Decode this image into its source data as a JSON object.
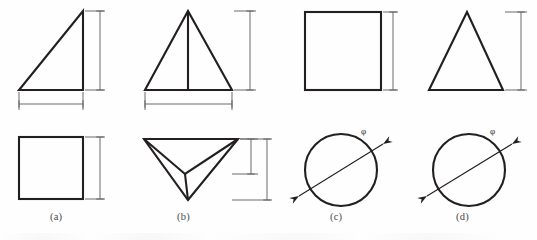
{
  "figure": {
    "type": "engineering-orthographic-projection-exercise",
    "caption_row_labels": [
      "(a)",
      "(b)",
      "(c)",
      "(d)"
    ],
    "rows": {
      "top_row_name": "elevation-views",
      "bottom_row_name": "plan-views"
    },
    "items": [
      {
        "id": "a",
        "label": "(a)",
        "label_x": 62,
        "label_y": 213,
        "elevation": {
          "shape": "right-triangle",
          "description": "right triangle with vertical right leg and horizontal bottom leg",
          "points": "20,90 20,90 83,90 83,12",
          "dimensions": [
            "vertical-right",
            "horizontal-bottom"
          ]
        },
        "plan": {
          "shape": "rectangle",
          "description": "rectangle plan view",
          "dimensions": [
            "vertical-right"
          ]
        }
      },
      {
        "id": "b",
        "label": "(b)",
        "label_x": 188,
        "label_y": 213,
        "elevation": {
          "shape": "isoceles-triangle-with-centerline",
          "description": "isoceles triangle with vertical center line from apex to base",
          "dimensions": [
            "vertical-right",
            "horizontal-bottom"
          ]
        },
        "plan": {
          "shape": "inverted-pyramid-pictorial",
          "description": "inverted triangular pyramid with visible internal converging edges",
          "dimensions": [
            "vertical-inner",
            "vertical-outer"
          ]
        }
      },
      {
        "id": "c",
        "label": "(c)",
        "label_x": 340,
        "label_y": 213,
        "elevation": {
          "shape": "square",
          "description": "square elevation",
          "dimensions": [
            "vertical-right"
          ]
        },
        "plan": {
          "shape": "circle-with-diameter",
          "description": "circle with inclined diameter leader line",
          "diameter_symbol": "φ",
          "dimensions": [
            "diameter-diagonal"
          ]
        }
      },
      {
        "id": "d",
        "label": "(d)",
        "label_x": 466,
        "label_y": 213,
        "elevation": {
          "shape": "isoceles-triangle",
          "description": "isoceles triangle elevation",
          "dimensions": [
            "vertical-right"
          ]
        },
        "plan": {
          "shape": "circle-with-diameter",
          "description": "circle with inclined diameter leader line",
          "diameter_symbol": "φ",
          "dimensions": [
            "diameter-diagonal"
          ]
        }
      }
    ],
    "symbols": {
      "diameter": "φ",
      "phi_c_x": 363,
      "phi_c_y": 133,
      "phi_d_x": 492,
      "phi_d_y": 133
    },
    "colors": {
      "outline": "#231f20",
      "dimension_line": "#6b6b6b",
      "label_text": "#4a4a4a",
      "background": "#fefefe"
    },
    "stroke_widths": {
      "object_outline": 2.1,
      "dimension": 1.0
    }
  }
}
